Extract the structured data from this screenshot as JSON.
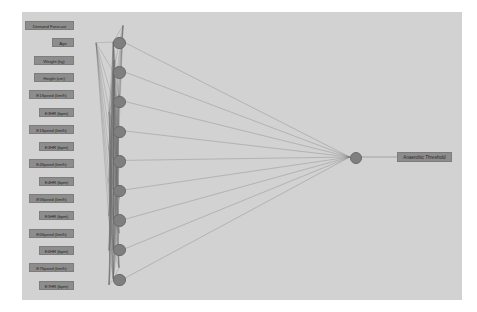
{
  "diagram": {
    "panel_color": "#d2d2d2",
    "page_color": "#ffffff",
    "node_color": "#7f7f7f",
    "label_color": "#8d8d8d",
    "edge_color": "#5a5a5a"
  },
  "input_layer": {
    "name": "input-layer",
    "count": 16,
    "nodes": [
      {
        "label": "Demand Forecast"
      },
      {
        "label": "Age"
      },
      {
        "label": "Weight (kg)"
      },
      {
        "label": "Height (cm)"
      },
      {
        "label": "E1Speed (km/h)"
      },
      {
        "label": "E3HR (bpm)"
      },
      {
        "label": "E1Speed (km/h)"
      },
      {
        "label": "E3HR (bpm)"
      },
      {
        "label": "E4Speed (km/h)"
      },
      {
        "label": "E4HR (bpm)"
      },
      {
        "label": "E5Speed (km/h)"
      },
      {
        "label": "E5HR (bpm)"
      },
      {
        "label": "E6Speed (km/h)"
      },
      {
        "label": "E6HR (bpm)"
      },
      {
        "label": "E7Speed (km/h)"
      },
      {
        "label": "E7HR (bpm)"
      }
    ]
  },
  "hidden_layer": {
    "name": "hidden-layer",
    "count": 9,
    "nodes": [
      {
        "label": "H1"
      },
      {
        "label": "H2"
      },
      {
        "label": "H3"
      },
      {
        "label": "H4"
      },
      {
        "label": "H5"
      },
      {
        "label": "H6"
      },
      {
        "label": "H7"
      },
      {
        "label": "H8"
      },
      {
        "label": "H9"
      }
    ]
  },
  "output_layer": {
    "name": "output-layer",
    "count": 1,
    "nodes": [
      {
        "label": "Anaerobic Threshold"
      }
    ]
  }
}
